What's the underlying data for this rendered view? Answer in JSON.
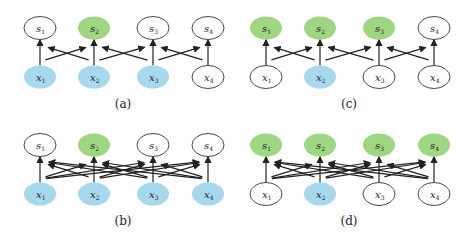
{
  "colors": {
    "observed_input": "#a8d8ee",
    "observed_output": "#9ed682",
    "plain": "#ffffff",
    "stroke": "#333333"
  },
  "node_labels": {
    "top": [
      {
        "sym": "s",
        "sub": "1"
      },
      {
        "sym": "s",
        "sub": "2"
      },
      {
        "sym": "s",
        "sub": "3"
      },
      {
        "sym": "s",
        "sub": "4"
      }
    ],
    "bottom": [
      {
        "sym": "x",
        "sub": "1"
      },
      {
        "sym": "x",
        "sub": "2"
      },
      {
        "sym": "x",
        "sub": "3"
      },
      {
        "sym": "x",
        "sub": "4"
      }
    ]
  },
  "panels": [
    {
      "id": "a",
      "caption": "(a)",
      "origin": [
        0,
        0
      ],
      "top_colored": [
        false,
        true,
        false,
        false
      ],
      "bottom_colored": [
        true,
        true,
        true,
        false
      ],
      "connectivity": "local",
      "edges": [
        [
          0,
          0
        ],
        [
          0,
          1
        ],
        [
          1,
          0
        ],
        [
          1,
          1
        ],
        [
          1,
          2
        ],
        [
          2,
          1
        ],
        [
          2,
          2
        ],
        [
          2,
          3
        ],
        [
          3,
          2
        ],
        [
          3,
          3
        ]
      ]
    },
    {
      "id": "c",
      "caption": "(c)",
      "origin": [
        226,
        0
      ],
      "top_colored": [
        true,
        true,
        true,
        false
      ],
      "bottom_colored": [
        false,
        true,
        false,
        false
      ],
      "connectivity": "local",
      "edges": [
        [
          0,
          0
        ],
        [
          0,
          1
        ],
        [
          1,
          0
        ],
        [
          1,
          1
        ],
        [
          1,
          2
        ],
        [
          2,
          1
        ],
        [
          2,
          2
        ],
        [
          2,
          3
        ],
        [
          3,
          2
        ],
        [
          3,
          3
        ]
      ]
    },
    {
      "id": "b",
      "caption": "(b)",
      "origin": [
        0,
        117
      ],
      "top_colored": [
        false,
        true,
        false,
        false
      ],
      "bottom_colored": [
        true,
        true,
        true,
        true
      ],
      "connectivity": "full",
      "edges": [
        [
          0,
          0
        ],
        [
          0,
          1
        ],
        [
          0,
          2
        ],
        [
          0,
          3
        ],
        [
          1,
          0
        ],
        [
          1,
          1
        ],
        [
          1,
          2
        ],
        [
          1,
          3
        ],
        [
          2,
          0
        ],
        [
          2,
          1
        ],
        [
          2,
          2
        ],
        [
          2,
          3
        ],
        [
          3,
          0
        ],
        [
          3,
          1
        ],
        [
          3,
          2
        ],
        [
          3,
          3
        ]
      ]
    },
    {
      "id": "d",
      "caption": "(d)",
      "origin": [
        226,
        117
      ],
      "top_colored": [
        true,
        true,
        true,
        true
      ],
      "bottom_colored": [
        false,
        true,
        false,
        false
      ],
      "connectivity": "full",
      "edges": [
        [
          0,
          0
        ],
        [
          0,
          1
        ],
        [
          0,
          2
        ],
        [
          0,
          3
        ],
        [
          1,
          0
        ],
        [
          1,
          1
        ],
        [
          1,
          2
        ],
        [
          1,
          3
        ],
        [
          2,
          0
        ],
        [
          2,
          1
        ],
        [
          2,
          2
        ],
        [
          2,
          3
        ],
        [
          3,
          0
        ],
        [
          3,
          1
        ],
        [
          3,
          2
        ],
        [
          3,
          3
        ]
      ]
    }
  ]
}
